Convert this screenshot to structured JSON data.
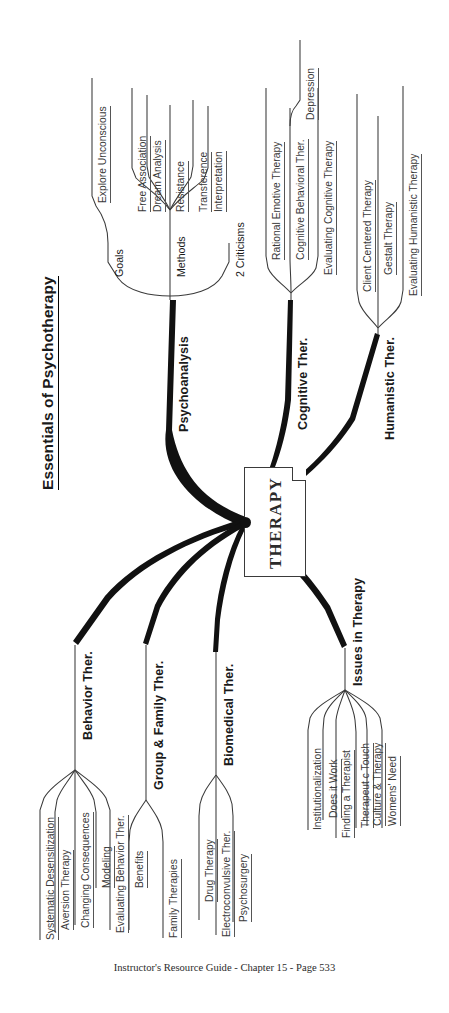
{
  "document": {
    "title": "Essentials of Psychotherapy",
    "footer": "Instructor's Resource Guide - Chapter 15 - Page 533",
    "center_node_label": "THERAPY",
    "orientation": "rotated-90-ccw",
    "colors": {
      "ink": "#1a1a1a",
      "branch_stroke": "#111111",
      "leaf_text": "#3a3a3a",
      "page_background": "#ffffff"
    }
  },
  "map": {
    "root": "THERAPY",
    "branches": [
      {
        "label": "Psychoanalysis",
        "children": [
          {
            "label": "Goals",
            "children": [
              {
                "label": "Explore Unconscious"
              }
            ]
          },
          {
            "label": "Methods",
            "children": [
              {
                "label": "Free Association"
              },
              {
                "label": "Dream Analysis"
              },
              {
                "label": "Resistance"
              },
              {
                "label": "Transference"
              },
              {
                "label": "Interpretation"
              }
            ]
          },
          {
            "label": "2 Criticisms",
            "children": []
          }
        ]
      },
      {
        "label": "Cognitive Ther.",
        "children": [
          {
            "label": "Rational Emotive Therapy"
          },
          {
            "label": "Cognitive Behavioral Ther.",
            "children": [
              {
                "label": "Depression"
              }
            ]
          },
          {
            "label": "Evaluating Cognitive Therapy"
          }
        ]
      },
      {
        "label": "Humanistic Ther.",
        "children": [
          {
            "label": "Client Centered Therapy"
          },
          {
            "label": "Gestalt Therapy"
          },
          {
            "label": "Evaluating Humanistic Therapy"
          }
        ]
      },
      {
        "label": "Behavior Ther.",
        "children": [
          {
            "label": "Systematic Desensitization"
          },
          {
            "label": "Aversion Therapy"
          },
          {
            "label": "Changing Consequences"
          },
          {
            "label": "Modeling"
          },
          {
            "label": "Evaluating Behavior Ther."
          }
        ]
      },
      {
        "label": "Group & Family Ther.",
        "children": [
          {
            "label": "Benefits"
          },
          {
            "label": "Family Therapies"
          }
        ]
      },
      {
        "label": "Biomedical Ther.",
        "children": [
          {
            "label": "Drug Therapy"
          },
          {
            "label": "Electroconvulsive Ther."
          },
          {
            "label": "Psychosurgery"
          }
        ]
      },
      {
        "label": "Issues in Therapy",
        "children": [
          {
            "label": "Institutionalization"
          },
          {
            "label": "Does it Work"
          },
          {
            "label": "Finding a Therapist"
          },
          {
            "label": "Therapeut c Touch"
          },
          {
            "label": "Culture & Therapy"
          },
          {
            "label": "Womens' Need"
          }
        ]
      }
    ]
  },
  "labels": {
    "title": "Essentials of Psychotherapy",
    "therapy": "THERAPY",
    "psychoanalysis": "Psychoanalysis",
    "goals": "Goals",
    "explore_unconscious": "Explore Unconscious",
    "methods": "Methods",
    "free_association": "Free Association",
    "dream_analysis": "Dream Analysis",
    "resistance": "Resistance",
    "transference": "Transference",
    "interpretation": "Interpretation",
    "two_criticisms": "2 Criticisms",
    "cognitive_ther": "Cognitive Ther.",
    "rational_emotive_therapy": "Rational Emotive Therapy",
    "cognitive_behavioral_ther": "Cognitive Behavioral Ther.",
    "depression": "Depression",
    "evaluating_cognitive_therapy": "Evaluating Cognitive Therapy",
    "humanistic_ther": "Humanistic Ther.",
    "client_centered_therapy": "Client Centered Therapy",
    "gestalt_therapy": "Gestalt Therapy",
    "evaluating_humanistic_therapy": "Evaluating Humanistic Therapy",
    "behavior_ther": "Behavior Ther.",
    "systematic_desensitization": "Systematic Desensitization",
    "aversion_therapy": "Aversion Therapy",
    "changing_consequences": "Changing Consequences",
    "modeling": "Modeling",
    "evaluating_behavior_ther": "Evaluating Behavior Ther.",
    "group_family_ther": "Group & Family Ther.",
    "benefits": "Benefits",
    "family_therapies": "Family Therapies",
    "biomedical_ther": "Biomedical Ther.",
    "drug_therapy": "Drug Therapy",
    "electroconvulsive_ther": "Electroconvulsive Ther.",
    "psychosurgery": "Psychosurgery",
    "issues_in_therapy": "Issues in Therapy",
    "institutionalization": "Institutionalization",
    "does_it_work": "Does it Work",
    "finding_a_therapist": "Finding a Therapist",
    "therapeutic_touch": "Therapeut c Touch",
    "culture_therapy": "Culture & Therapy",
    "womens_need": "Womens' Need",
    "footer": "Instructor's Resource Guide - Chapter 15 - Page 533"
  }
}
